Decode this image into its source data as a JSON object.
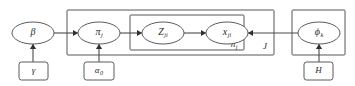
{
  "figure": {
    "kind": "plate-notation-graphical-model",
    "background_color": "#ffffff",
    "stroke_color": "#565656",
    "text_color": "#2a2a2a"
  },
  "nodes": [
    {
      "id": "beta",
      "name": "beta-node",
      "symbol": "β",
      "subscript": "",
      "shape": "ellipse",
      "cx": 33,
      "cy": 33,
      "rx": 21,
      "ry": 11
    },
    {
      "id": "pi_j",
      "name": "pi-j-node",
      "symbol": "π",
      "subscript": "j",
      "shape": "ellipse",
      "cx": 99,
      "cy": 33,
      "rx": 21,
      "ry": 11
    },
    {
      "id": "z_ji",
      "name": "z-ji-node",
      "symbol": "Z",
      "subscript": "ji",
      "shape": "ellipse",
      "cx": 163,
      "cy": 33,
      "rx": 21,
      "ry": 11
    },
    {
      "id": "x_ji",
      "name": "x-ji-node",
      "symbol": "x",
      "subscript": "ji",
      "shape": "ellipse",
      "cx": 227,
      "cy": 33,
      "rx": 21,
      "ry": 11
    },
    {
      "id": "phi_k",
      "name": "phi-k-node",
      "symbol": "ϕ",
      "subscript": "k",
      "shape": "ellipse",
      "cx": 319,
      "cy": 33,
      "rx": 21,
      "ry": 11
    }
  ],
  "parameters": [
    {
      "id": "gamma",
      "name": "gamma-parameter-box",
      "symbol": "γ",
      "subscript": "",
      "shape": "rect",
      "x": 19,
      "y": 62,
      "w": 29,
      "h": 18
    },
    {
      "id": "alpha0",
      "name": "alpha-zero-parameter-box",
      "symbol": "α",
      "subscript": "0",
      "shape": "rect",
      "x": 84,
      "y": 62,
      "w": 30,
      "h": 18
    },
    {
      "id": "H",
      "name": "h-parameter-box",
      "symbol": "H",
      "subscript": "",
      "shape": "rect",
      "x": 304,
      "y": 62,
      "w": 29,
      "h": 18
    }
  ],
  "plates": [
    {
      "id": "plate_J",
      "name": "outer-plate-j",
      "label": "J",
      "x": 67,
      "y": 10,
      "w": 207,
      "h": 45,
      "label_x": 265,
      "label_y": 47
    },
    {
      "id": "plate_nj",
      "name": "inner-plate-nj",
      "label": "n",
      "label_subscript": "j",
      "x": 130,
      "y": 15,
      "w": 114,
      "h": 35,
      "label_x": 234,
      "label_y": 45
    },
    {
      "id": "plate_K",
      "name": "right-plate-phi",
      "label": "",
      "x": 292,
      "y": 10,
      "w": 53,
      "h": 45,
      "label_x": 338,
      "label_y": 48
    }
  ],
  "edges": [
    {
      "id": "beta_to_pi",
      "name": "edge-beta-to-pi",
      "from": "beta",
      "to": "pi_j",
      "direction": "right",
      "x1": 54,
      "y1": 33,
      "x2": 78,
      "y2": 33
    },
    {
      "id": "pi_to_z",
      "name": "edge-pi-to-z",
      "from": "pi_j",
      "to": "z_ji",
      "direction": "right",
      "x1": 120,
      "y1": 33,
      "x2": 142,
      "y2": 33
    },
    {
      "id": "z_to_x",
      "name": "edge-z-to-x",
      "from": "z_ji",
      "to": "x_ji",
      "direction": "right",
      "x1": 184,
      "y1": 33,
      "x2": 206,
      "y2": 33
    },
    {
      "id": "phi_to_x",
      "name": "edge-phi-to-x",
      "from": "phi_k",
      "to": "x_ji",
      "direction": "left",
      "x1": 298,
      "y1": 33,
      "x2": 248,
      "y2": 33
    },
    {
      "id": "gamma_to_beta",
      "name": "edge-gamma-to-beta",
      "from": "gamma",
      "to": "beta",
      "direction": "up",
      "x1": 33,
      "y1": 62,
      "x2": 33,
      "y2": 44
    },
    {
      "id": "alpha0_to_pi",
      "name": "edge-alpha-to-pi",
      "from": "alpha0",
      "to": "pi_j",
      "direction": "up",
      "x1": 99,
      "y1": 62,
      "x2": 99,
      "y2": 44
    },
    {
      "id": "H_to_phi",
      "name": "edge-h-to-phi",
      "from": "H",
      "to": "phi_k",
      "direction": "up",
      "x1": 319,
      "y1": 62,
      "x2": 319,
      "y2": 44
    }
  ]
}
